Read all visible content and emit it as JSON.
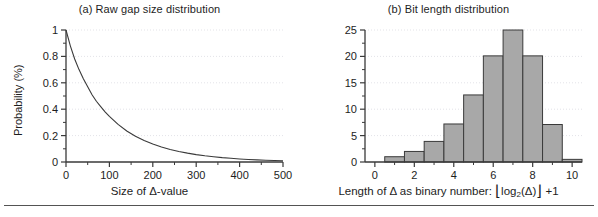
{
  "figure": {
    "bottom_rule": true,
    "background_color": "#ffffff",
    "axis_color": "#3a3a3a",
    "grid_color": "#e3e3e8",
    "bar_fill_color": "#a8a8a8",
    "bar_stroke_color": "#3a3a3a",
    "curve_color": "#3a3a3a"
  },
  "panels": [
    {
      "id": "a",
      "title": "(a) Raw gap size distribution",
      "ylabel": "Probability (%)",
      "xlabel_prefix": "Size of ",
      "xlabel_delta": "Δ",
      "xlabel_suffix": "-value"
    },
    {
      "id": "b",
      "title": "(b) Bit length distribution",
      "ylabel": "Probability (%)",
      "xlabel_prefix": "Length of ",
      "xlabel_delta": "Δ",
      "xlabel_mid": " as binary number:  ",
      "xlabel_floor_open": "⌊",
      "xlabel_log": "log",
      "xlabel_logsub": "2",
      "xlabel_arg": "(Δ)",
      "xlabel_floor_close": "⌋",
      "xlabel_plus": " +1"
    }
  ],
  "chart_data": [
    {
      "type": "line",
      "title": "(a) Raw gap size distribution",
      "xlabel": "Size of Δ-value",
      "ylabel": "Probability (%)",
      "xlim": [
        0,
        500
      ],
      "ylim": [
        0,
        1
      ],
      "xticks": [
        0,
        100,
        200,
        300,
        400,
        500
      ],
      "xtick_labels": [
        "0",
        "100",
        "200",
        "300",
        "400",
        "500"
      ],
      "xminor_ticks": [
        50,
        150,
        250,
        350,
        450
      ],
      "yticks": [
        0,
        0.2,
        0.4,
        0.6,
        0.8,
        1
      ],
      "ytick_labels": [
        "0",
        "0.2",
        "0.4",
        "0.6",
        "0.8",
        "1"
      ],
      "yminor_ticks": [
        0.1,
        0.3,
        0.5,
        0.7,
        0.9
      ],
      "grid": true,
      "legend": null,
      "x": [
        0,
        10,
        20,
        30,
        40,
        50,
        60,
        70,
        80,
        90,
        100,
        120,
        140,
        160,
        180,
        200,
        220,
        240,
        260,
        280,
        300,
        320,
        340,
        360,
        380,
        400,
        420,
        440,
        460,
        480,
        500
      ],
      "y": [
        1.0,
        0.88,
        0.78,
        0.7,
        0.63,
        0.57,
        0.51,
        0.46,
        0.42,
        0.38,
        0.345,
        0.285,
        0.235,
        0.195,
        0.163,
        0.136,
        0.114,
        0.095,
        0.08,
        0.067,
        0.056,
        0.047,
        0.04,
        0.033,
        0.028,
        0.023,
        0.019,
        0.016,
        0.013,
        0.011,
        0.009
      ]
    },
    {
      "type": "bar",
      "title": "(b) Bit length distribution",
      "xlabel": "Length of Δ as binary number: ⌊log2(Δ)⌋ +1",
      "ylabel": "Probability (%)",
      "xlim": [
        -0.5,
        10.5
      ],
      "ylim": [
        0,
        25
      ],
      "xticks": [
        0,
        2,
        4,
        6,
        8,
        10
      ],
      "xtick_labels": [
        "0",
        "2",
        "4",
        "6",
        "8",
        "10"
      ],
      "xminor_ticks": [
        1,
        3,
        5,
        7,
        9
      ],
      "yticks": [
        0,
        5,
        10,
        15,
        20,
        25
      ],
      "ytick_labels": [
        "0",
        "5",
        "10",
        "15",
        "20",
        "25"
      ],
      "yminor_ticks": [
        2.5,
        7.5,
        12.5,
        17.5,
        22.5
      ],
      "grid": true,
      "legend": null,
      "categories": [
        1,
        2,
        3,
        4,
        5,
        6,
        7,
        8,
        9,
        10
      ],
      "values": [
        1.0,
        2.0,
        3.9,
        7.2,
        12.7,
        20.1,
        25.0,
        20.1,
        7.1,
        0.5
      ]
    }
  ]
}
